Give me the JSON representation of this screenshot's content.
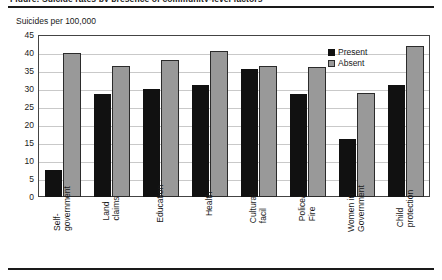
{
  "figure": {
    "clipped_caption": "Figure: Suicide rates by presence of community-level factors",
    "axis_title": "Suicides per 100,000"
  },
  "legend": {
    "position": "top-right",
    "entries": [
      {
        "label": "Present",
        "color": "#111111"
      },
      {
        "label": "Absent",
        "color": "#999999"
      }
    ]
  },
  "yaxis": {
    "ticks": [
      "45",
      "40",
      "35",
      "30",
      "25",
      "20",
      "15",
      "10",
      "5",
      "0"
    ]
  },
  "chart_data": {
    "type": "bar",
    "title": "",
    "subtitle": "",
    "xlabel": "",
    "ylabel": "Suicides per 100,000",
    "ylim": [
      0,
      45
    ],
    "ytick_step": 5,
    "grid": true,
    "legend_position": "top-right",
    "categories": [
      "Self-\ngovernment",
      "Land\nclaims",
      "Education",
      "Health",
      "Cultural\nfacil",
      "Police/\nFire",
      "Women in\nGovernment",
      "Child\nprotection"
    ],
    "series": [
      {
        "name": "Present",
        "color": "#111111",
        "values": [
          7.5,
          28.5,
          30.0,
          31.0,
          35.5,
          28.5,
          16.0,
          31.0
        ]
      },
      {
        "name": "Absent",
        "color": "#999999",
        "values": [
          40.0,
          36.5,
          38.0,
          40.5,
          36.5,
          36.0,
          29.0,
          42.0
        ]
      }
    ]
  }
}
